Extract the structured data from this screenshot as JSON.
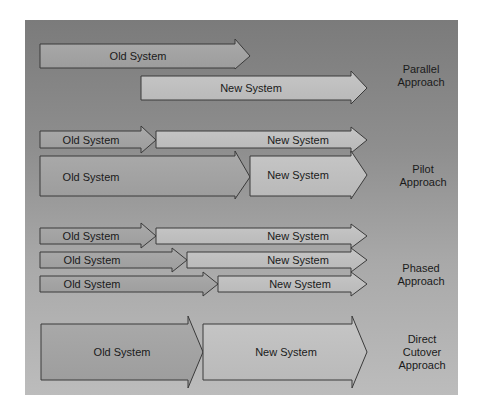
{
  "approaches": [
    {
      "name": "Parallel Approach",
      "label_lines": [
        "Parallel",
        "Approach"
      ],
      "arrows": [
        {
          "label": "Old System",
          "kind": "old"
        },
        {
          "label": "New System",
          "kind": "new"
        }
      ]
    },
    {
      "name": "Pilot Approach",
      "label_lines": [
        "Pilot",
        "Approach"
      ],
      "arrows": [
        {
          "label": "Old System",
          "kind": "old"
        },
        {
          "label": "New System",
          "kind": "new"
        },
        {
          "label": "Old System",
          "kind": "old"
        },
        {
          "label": "New System",
          "kind": "new"
        }
      ]
    },
    {
      "name": "Phased Approach",
      "label_lines": [
        "Phased",
        "Approach"
      ],
      "arrows": [
        {
          "label": "Old System",
          "kind": "old"
        },
        {
          "label": "New System",
          "kind": "new"
        },
        {
          "label": "Old System",
          "kind": "old"
        },
        {
          "label": "New System",
          "kind": "new"
        },
        {
          "label": "Old System",
          "kind": "old"
        },
        {
          "label": "New System",
          "kind": "new"
        }
      ]
    },
    {
      "name": "Direct Cutover Approach",
      "label_lines": [
        "Direct",
        "Cutover",
        "Approach"
      ],
      "arrows": [
        {
          "label": "Old System",
          "kind": "old"
        },
        {
          "label": "New System",
          "kind": "new"
        }
      ]
    }
  ],
  "colors": {
    "old_fill": "#a4a4a4",
    "new_fill": "#c4c4c4",
    "stroke": "#3a3a3a"
  }
}
